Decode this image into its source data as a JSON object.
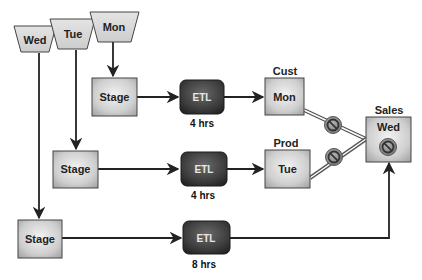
{
  "sources": [
    {
      "id": "wed",
      "label": "Wed"
    },
    {
      "id": "tue",
      "label": "Tue"
    },
    {
      "id": "mon",
      "label": "Mon"
    }
  ],
  "stages": [
    {
      "label": "Stage"
    },
    {
      "label": "Stage"
    },
    {
      "label": "Stage"
    }
  ],
  "etl": [
    {
      "label": "ETL",
      "duration": "4 hrs"
    },
    {
      "label": "ETL",
      "duration": "4 hrs"
    },
    {
      "label": "ETL",
      "duration": "8 hrs"
    }
  ],
  "targets": [
    {
      "title": "Cust",
      "label": "Mon"
    },
    {
      "title": "Prod",
      "label": "Tue"
    },
    {
      "title": "Sales",
      "label": "Wed"
    }
  ],
  "icons": {
    "blocked": "no-entry-icon"
  },
  "colors": {
    "box_fill_light": "#e6e6e6",
    "box_fill_dark": "#a9a9a9",
    "etl_fill": "#3a3a3a",
    "line": "#222222"
  }
}
